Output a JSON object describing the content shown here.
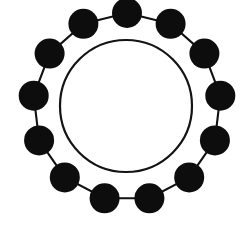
{
  "figure": {
    "type": "diagram",
    "background_color": "#ffffff",
    "canvas": {
      "width": 246,
      "height": 225
    }
  },
  "graph": {
    "kind": "cycle-graph",
    "node_count": 13,
    "edge_count": 13,
    "node_color": "#0d0d0d",
    "edge_color": "#111111",
    "node_radius": 15,
    "edge_width": 2.1,
    "ring_center": {
      "x": 127,
      "y": 107
    },
    "ring_radius": 94,
    "nodes": [
      {
        "id": "n1",
        "label": "",
        "angle_deg": -90.0,
        "x": 127.0,
        "y": 13.0
      },
      {
        "id": "n2",
        "label": "",
        "angle_deg": -62.3,
        "x": 170.6,
        "y": 23.8
      },
      {
        "id": "n3",
        "label": "",
        "angle_deg": -34.6,
        "x": 204.4,
        "y": 53.6
      },
      {
        "id": "n4",
        "label": "",
        "angle_deg": -6.9,
        "x": 220.3,
        "y": 95.7
      },
      {
        "id": "n5",
        "label": "",
        "angle_deg": 20.8,
        "x": 214.9,
        "y": 140.4
      },
      {
        "id": "n6",
        "label": "",
        "angle_deg": 48.5,
        "x": 189.2,
        "y": 177.4
      },
      {
        "id": "n7",
        "label": "",
        "angle_deg": 76.2,
        "x": 149.4,
        "y": 198.3
      },
      {
        "id": "n8",
        "label": "",
        "angle_deg": 103.8,
        "x": 104.6,
        "y": 198.3
      },
      {
        "id": "n9",
        "label": "",
        "angle_deg": 131.5,
        "x": 64.8,
        "y": 177.4
      },
      {
        "id": "n10",
        "label": "",
        "angle_deg": 159.2,
        "x": 39.1,
        "y": 140.4
      },
      {
        "id": "n11",
        "label": "",
        "angle_deg": 186.9,
        "x": 33.7,
        "y": 95.7
      },
      {
        "id": "n12",
        "label": "",
        "angle_deg": 214.6,
        "x": 49.6,
        "y": 53.6
      },
      {
        "id": "n13",
        "label": "",
        "angle_deg": 242.3,
        "x": 83.4,
        "y": 23.8
      }
    ],
    "edges": [
      {
        "from": "n1",
        "to": "n2"
      },
      {
        "from": "n2",
        "to": "n3"
      },
      {
        "from": "n3",
        "to": "n4"
      },
      {
        "from": "n4",
        "to": "n5"
      },
      {
        "from": "n5",
        "to": "n6"
      },
      {
        "from": "n6",
        "to": "n7"
      },
      {
        "from": "n7",
        "to": "n8"
      },
      {
        "from": "n8",
        "to": "n9"
      },
      {
        "from": "n9",
        "to": "n10"
      },
      {
        "from": "n10",
        "to": "n11"
      },
      {
        "from": "n11",
        "to": "n12"
      },
      {
        "from": "n12",
        "to": "n13"
      },
      {
        "from": "n13",
        "to": "n1"
      }
    ]
  },
  "inner_circle": {
    "center": {
      "x": 126,
      "y": 106
    },
    "radius": 66,
    "stroke_color": "#131313",
    "stroke_width": 2.2,
    "fill": "none"
  }
}
